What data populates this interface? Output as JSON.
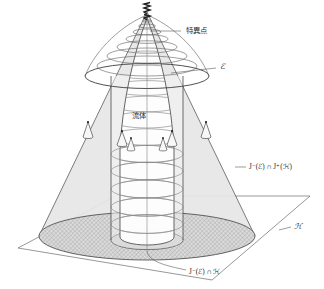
{
  "figure": {
    "background_color": "#ffffff",
    "line_color": "#4a4a4a",
    "text_color": "#2b2b2b",
    "cone_fill_color": "#e6e6e6",
    "hatch_fill_color": "#d6d6d6",
    "inner_disk_color": "#c9c9c9",
    "fluid_fill_color": "#fdfdfd"
  },
  "labels": {
    "singularity": {
      "text": "特異点",
      "x": 186,
      "y": 31
    },
    "fluid": {
      "text": "流体",
      "x": 139,
      "y": 116
    },
    "scri": {
      "text": "ℰ",
      "x": 222,
      "y": 69
    },
    "causal_region": {
      "text": "J⁻(ℰ) ∩ J⁺(ℋ)",
      "x": 249,
      "y": 167
    },
    "horizon_plane": {
      "text": "ℋ",
      "x": 295,
      "y": 227
    },
    "intersection": {
      "text": "J⁻(ℰ) ∩ ℋ",
      "x": 200,
      "y": 272
    }
  },
  "geometry": {
    "axis_x": 147,
    "axis_top_y": 14,
    "axis_bottom_y": 253,
    "plane_corners": "18,248 116,196 310,196 212,280",
    "outer_cone_apex": {
      "x": 147,
      "y": 12
    },
    "outer_cone_base_cy": 236,
    "outer_cone_base_rx": 108,
    "outer_cone_base_ry": 24,
    "horizon_cylinder_rx": 36,
    "horizon_cylinder_ry": 9,
    "scri_ellipse_cy": 76,
    "scri_ellipse_rx": 62,
    "scri_ellipse_ry": 12,
    "num_fluid_rings": 11,
    "num_lightcones": 6
  }
}
